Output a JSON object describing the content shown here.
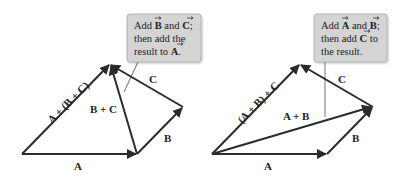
{
  "diagram": {
    "left": {
      "callout": {
        "line1_pre": "Add ",
        "line1_v1": "B",
        "line1_mid": " and ",
        "line1_v2": "C",
        "line1_post": ";",
        "line2": "then add the",
        "line3_pre": "result to ",
        "line3_v": "A",
        "line3_post": "."
      },
      "labels": {
        "a": "A",
        "b": "B",
        "c": "C",
        "bc": "B + C",
        "sum": "A + (B + C)"
      }
    },
    "right": {
      "callout": {
        "line1_pre": "Add ",
        "line1_v1": "A",
        "line1_mid": " and ",
        "line1_v2": "B",
        "line1_post": ";",
        "line2_pre": "then add ",
        "line2_v": "C",
        "line2_post": " to",
        "line3": "the result."
      },
      "labels": {
        "a": "A",
        "b": "B",
        "c": "C",
        "ab": "A + B",
        "sum": "(A + B) + C"
      }
    },
    "colors": {
      "vector": "#2b2b2b",
      "callout_fill": "#d4d4d4",
      "callout_stroke": "#a8a8a8",
      "pointer": "#8a8a8a"
    }
  }
}
